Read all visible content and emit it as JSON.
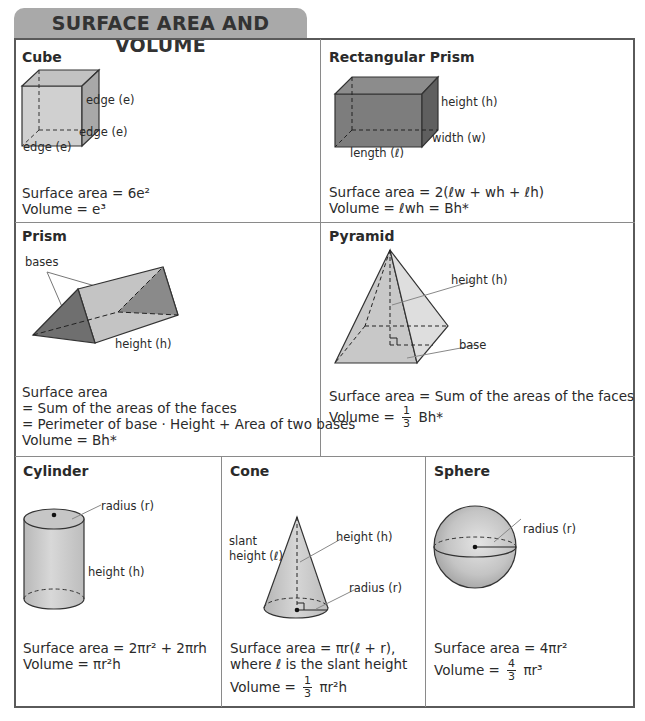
{
  "title": "SURFACE AREA AND VOLUME",
  "cells": {
    "cube": {
      "title": "Cube",
      "labels": [
        "edge (e)",
        "edge (e)",
        "edge (e)"
      ],
      "surface_area": "Surface area = 6e²",
      "volume": "Volume = e³"
    },
    "rect_prism": {
      "title": "Rectangular Prism",
      "labels": {
        "height": "height (h)",
        "width": "width (w)",
        "length": "length (ℓ)"
      },
      "surface_area": "Surface area = 2(ℓw + wh + ℓh)",
      "volume": "Volume = ℓwh = Bh*"
    },
    "prism": {
      "title": "Prism",
      "labels": {
        "bases": "bases",
        "height": "height (h)"
      },
      "lines": [
        "Surface area",
        "= Sum of the areas of the faces",
        "= Perimeter of base · Height + Area of two bases",
        "Volume = Bh*"
      ]
    },
    "pyramid": {
      "title": "Pyramid",
      "labels": {
        "height": "height (h)",
        "base": "base"
      },
      "surface_area": "Surface area = Sum of the areas of the faces",
      "volume_prefix": "Volume =",
      "volume_frac_num": "1",
      "volume_frac_den": "3",
      "volume_suffix": "Bh*"
    },
    "cylinder": {
      "title": "Cylinder",
      "labels": {
        "radius": "radius (r)",
        "height": "height (h)"
      },
      "surface_area": "Surface area = 2πr² + 2πrh",
      "volume": "Volume = πr²h"
    },
    "cone": {
      "title": "Cone",
      "labels": {
        "slant1": "slant",
        "slant2": "height (ℓ)",
        "height": "height (h)",
        "radius": "radius (r)"
      },
      "surface_area": "Surface area = πr(ℓ + r),",
      "surface_area_note": "where ℓ is the slant height",
      "volume_prefix": "Volume =",
      "volume_frac_num": "1",
      "volume_frac_den": "3",
      "volume_suffix": "πr²h"
    },
    "sphere": {
      "title": "Sphere",
      "labels": {
        "radius": "radius (r)"
      },
      "surface_area": "Surface area = 4πr²",
      "volume_prefix": "Volume =",
      "volume_frac_num": "4",
      "volume_frac_den": "3",
      "volume_suffix": "πr³"
    }
  },
  "colors": {
    "title_tab": "#a9a9a9",
    "frame": "#5a5a5a",
    "shape_light": "#d4d4d4",
    "shape_dark": "#7a7a7a"
  }
}
